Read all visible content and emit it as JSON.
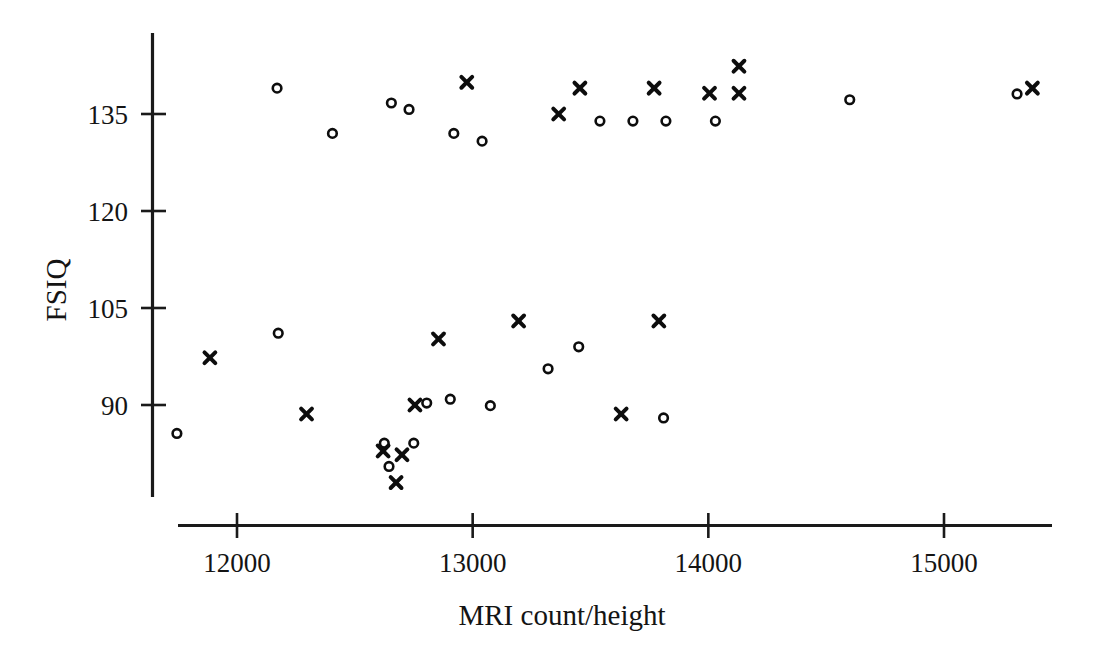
{
  "chart_data": {
    "type": "scatter",
    "title": "",
    "xlabel": "MRI count/height",
    "ylabel": "FSIQ",
    "xlim": [
      11700,
      15500
    ],
    "ylim": [
      80,
      142
    ],
    "grid": false,
    "legend": null,
    "xticks": [
      12000,
      13000,
      14000,
      15000
    ],
    "xtick_labels": [
      "12000",
      "13000",
      "14000",
      "15000"
    ],
    "yticks": [
      90,
      105,
      120,
      135
    ],
    "ytick_labels": [
      "90",
      "105",
      "120",
      "135"
    ],
    "marker_colors": {
      "circle": "#0d0d0d",
      "cross": "#0d0d0d"
    },
    "series": [
      {
        "name": "circle",
        "marker": "o",
        "points": [
          {
            "x": 11745,
            "y": 85.6
          },
          {
            "x": 12170,
            "y": 139.0
          },
          {
            "x": 12175,
            "y": 101.1
          },
          {
            "x": 12405,
            "y": 132.0
          },
          {
            "x": 12625,
            "y": 84.1
          },
          {
            "x": 12645,
            "y": 80.5
          },
          {
            "x": 12655,
            "y": 136.7
          },
          {
            "x": 12730,
            "y": 135.7
          },
          {
            "x": 12750,
            "y": 84.1
          },
          {
            "x": 12805,
            "y": 90.3
          },
          {
            "x": 12905,
            "y": 90.9
          },
          {
            "x": 13075,
            "y": 89.9
          },
          {
            "x": 12920,
            "y": 132.0
          },
          {
            "x": 13040,
            "y": 130.8
          },
          {
            "x": 13320,
            "y": 95.6
          },
          {
            "x": 13450,
            "y": 99.0
          },
          {
            "x": 13810,
            "y": 88.0
          },
          {
            "x": 13540,
            "y": 133.9
          },
          {
            "x": 13680,
            "y": 133.9
          },
          {
            "x": 13820,
            "y": 133.9
          },
          {
            "x": 14030,
            "y": 133.9
          },
          {
            "x": 14600,
            "y": 137.2
          },
          {
            "x": 15310,
            "y": 138.1
          }
        ]
      },
      {
        "name": "cross",
        "marker": "x",
        "points": [
          {
            "x": 11885,
            "y": 97.3
          },
          {
            "x": 12295,
            "y": 88.6
          },
          {
            "x": 12620,
            "y": 82.9
          },
          {
            "x": 12675,
            "y": 78.0
          },
          {
            "x": 12700,
            "y": 82.3
          },
          {
            "x": 12755,
            "y": 90.0
          },
          {
            "x": 12855,
            "y": 100.2
          },
          {
            "x": 12975,
            "y": 139.9
          },
          {
            "x": 13195,
            "y": 103.0
          },
          {
            "x": 13365,
            "y": 135.0
          },
          {
            "x": 13455,
            "y": 139.0
          },
          {
            "x": 13630,
            "y": 88.6
          },
          {
            "x": 13790,
            "y": 103.0
          },
          {
            "x": 13770,
            "y": 139.0
          },
          {
            "x": 14005,
            "y": 138.2
          },
          {
            "x": 14130,
            "y": 142.4
          },
          {
            "x": 14130,
            "y": 138.2
          },
          {
            "x": 15375,
            "y": 139.0
          }
        ]
      }
    ]
  },
  "axes": {
    "y_title": "FSIQ",
    "x_title": "MRI count/height"
  }
}
